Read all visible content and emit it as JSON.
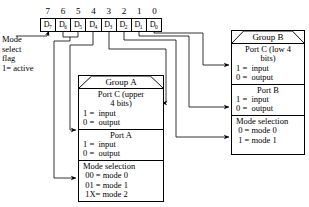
{
  "register": {
    "name": "control-word-bits",
    "bit_numbers": [
      "7",
      "6",
      "5",
      "4",
      "3",
      "2",
      "1",
      "0"
    ],
    "cells": [
      {
        "label": "D",
        "index": "7"
      },
      {
        "label": "D",
        "index": "6"
      },
      {
        "label": "D",
        "index": "5"
      },
      {
        "label": "D",
        "index": "4"
      },
      {
        "label": "D",
        "index": "3"
      },
      {
        "label": "D",
        "index": "2"
      },
      {
        "label": "D",
        "index": "1"
      },
      {
        "label": "D",
        "index": "0"
      }
    ]
  },
  "mode_select_flag": {
    "line1": "Mode",
    "line2": "select",
    "line3": "flag",
    "line4": "1= active"
  },
  "group_a": {
    "header": "Group A",
    "sections": [
      {
        "name": "port-c-upper",
        "lines": [
          "Port C (upper",
          "4 bits)",
          "1 =  input",
          "0 =  output"
        ],
        "align": [
          "c",
          "c",
          "l",
          "l"
        ]
      },
      {
        "name": "port-a",
        "lines": [
          "Port A",
          "1 =  input",
          "0 =  output"
        ],
        "align": [
          "c",
          "l",
          "l"
        ]
      },
      {
        "name": "mode-selection-a",
        "lines": [
          "Mode selection",
          " 00 = mode 0",
          " 01 = mode 1",
          " 1X= mode 2"
        ],
        "align": [
          "l",
          "l",
          "l",
          "l"
        ]
      }
    ]
  },
  "group_b": {
    "header": "Group B",
    "sections": [
      {
        "name": "port-c-low",
        "lines": [
          "Port C (low 4",
          "bits)",
          "1 =  input",
          "0 =  output"
        ],
        "align": [
          "c",
          "c",
          "l",
          "l"
        ]
      },
      {
        "name": "port-b",
        "lines": [
          "Port B",
          "1 =  input",
          "0 =  output"
        ],
        "align": [
          "c",
          "l",
          "l"
        ]
      },
      {
        "name": "mode-selection-b",
        "lines": [
          "Mode selection",
          " 0 = mode 0",
          " 1 = mode 1"
        ],
        "align": [
          "l",
          "l",
          "l"
        ]
      }
    ]
  },
  "connections": [
    {
      "from_bit": "7",
      "to": "mode-select-flag"
    },
    {
      "from_bit": "6",
      "to": "mode-selection-a"
    },
    {
      "from_bit": "5",
      "to": "mode-selection-a"
    },
    {
      "from_bit": "4",
      "to": "port-a"
    },
    {
      "from_bit": "3",
      "to": "port-c-upper"
    },
    {
      "from_bit": "2",
      "to": "mode-selection-b"
    },
    {
      "from_bit": "1",
      "to": "port-b"
    },
    {
      "from_bit": "0",
      "to": "port-c-low"
    }
  ],
  "colors": {
    "line": "#000000",
    "background": "#ffffff"
  }
}
